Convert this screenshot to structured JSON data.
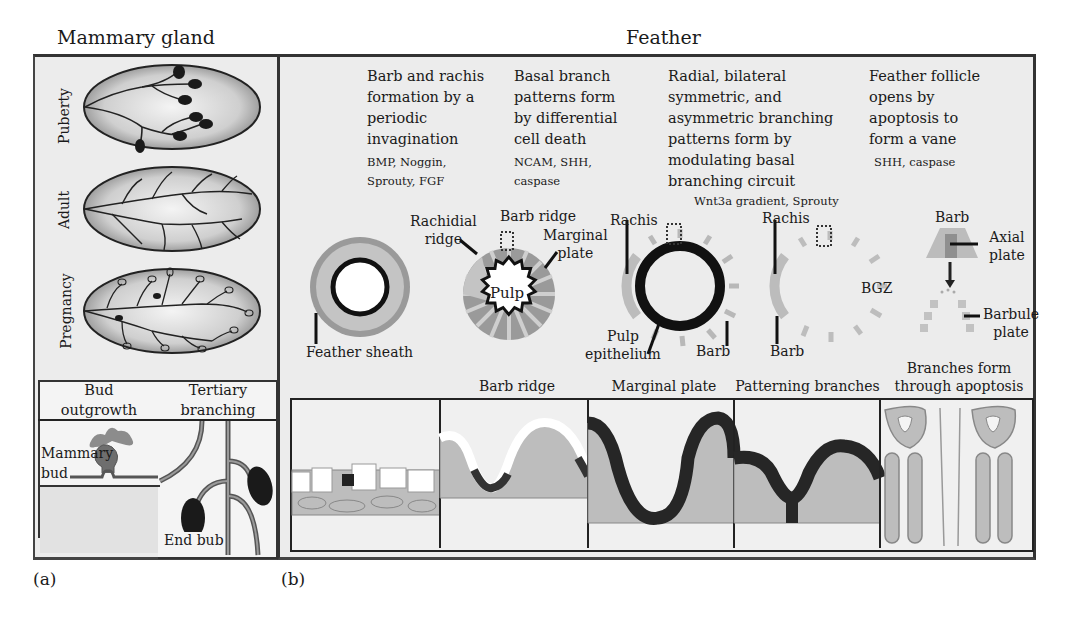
{
  "panel_a": {
    "title": "Mammary gland",
    "stages": [
      {
        "label": "Puberty"
      },
      {
        "label": "Adult"
      },
      {
        "label": "Pregnancy"
      }
    ],
    "boxes": [
      {
        "header": "Bud\noutgrowth",
        "annotation": "Mammary\nbud"
      },
      {
        "header": "Tertiary\nbranching",
        "annotation": "End bub"
      }
    ],
    "panel_letter": "(a)"
  },
  "panel_b": {
    "title": "Feather",
    "columns": [
      {
        "description": "Barb and rachis\nformation by a\nperiodic\ninvagination",
        "factors": "BMP, Noggin,\nSprouty, FGF"
      },
      {
        "description": "Basal branch\npatterns form\nby differential\ncell death",
        "factors": "NCAM, SHH,\ncaspase"
      },
      {
        "description": "Radial, bilateral\nsymmetric, and\nasymmetric branching\npatterns form by\nmodulating basal\nbranching circuit",
        "factors": "Wnt3a gradient, Sprouty"
      },
      {
        "description": "Feather follicle\nopens by\napoptosis to\nform a vane",
        "factors": "SHH, caspase"
      }
    ],
    "diagram_labels": {
      "feather_sheath": "Feather sheath",
      "rachidial_ridge": "Rachidial\nridge",
      "barb_ridge": "Barb ridge",
      "marginal_plate": "Marginal\nplate",
      "pulp": "Pulp",
      "rachis_1": "Rachis",
      "pulp_epithelium": "Pulp\nepithelium",
      "barb_1": "Barb",
      "rachis_2": "Rachis",
      "barb_2": "Barb",
      "bgz": "BGZ",
      "barb_3": "Barb",
      "axial_plate": "Axial\nplate",
      "barbule_plate": "Barbule\nplate"
    },
    "section_labels": [
      "",
      "Barb ridge",
      "Marginal plate",
      "Patterning branches",
      "Branches form\nthrough apoptosis"
    ],
    "panel_letter": "(b)"
  },
  "colors": {
    "background": "#ececec",
    "light_gray": "#bdbdbd",
    "mid_gray": "#8f8f8f",
    "dark": "#262626",
    "frame": "#333333"
  }
}
